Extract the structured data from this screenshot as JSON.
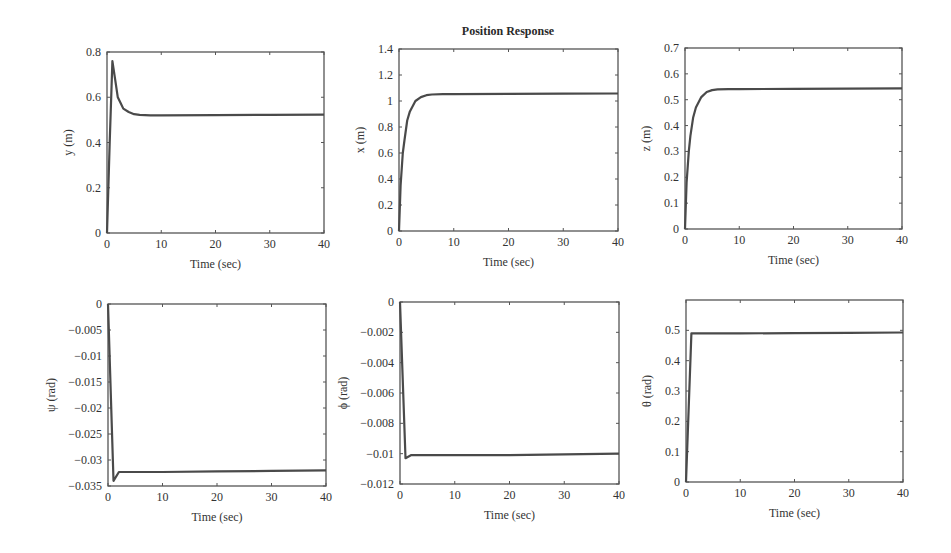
{
  "figure": {
    "title": "Position Response"
  },
  "chart_data": [
    {
      "type": "line",
      "title": "Position Response",
      "position": "top-left",
      "xlabel": "Time (sec)",
      "ylabel": "y (m)",
      "xlim": [
        0,
        40
      ],
      "ylim": [
        0,
        0.8
      ],
      "xticks": [
        0,
        10,
        20,
        30,
        40
      ],
      "yticks": [
        0,
        0.2,
        0.4,
        0.6,
        0.8
      ],
      "ytick_labels": [
        "0",
        "0.2",
        "0.4",
        "0.6",
        "0.8"
      ],
      "grid": false,
      "series": [
        {
          "name": "y",
          "x": [
            0,
            0.5,
            1,
            1.5,
            2,
            2.5,
            3,
            4,
            5,
            6,
            8,
            10,
            20,
            30,
            40
          ],
          "values": [
            0,
            0.4,
            0.76,
            0.68,
            0.6,
            0.575,
            0.55,
            0.535,
            0.525,
            0.522,
            0.52,
            0.52,
            0.521,
            0.522,
            0.523
          ]
        }
      ]
    },
    {
      "type": "line",
      "position": "top-middle",
      "xlabel": "Time (sec)",
      "ylabel": "x (m)",
      "xlim": [
        0,
        40
      ],
      "ylim": [
        0,
        1.4
      ],
      "xticks": [
        0,
        10,
        20,
        30,
        40
      ],
      "yticks": [
        0,
        0.2,
        0.4,
        0.6,
        0.8,
        1,
        1.2,
        1.4
      ],
      "ytick_labels": [
        "0",
        "0.2",
        "0.4",
        "0.6",
        "0.8",
        "1",
        "1.2",
        "1.4"
      ],
      "grid": false,
      "series": [
        {
          "name": "x",
          "x": [
            0,
            0.3,
            0.7,
            1,
            1.5,
            2,
            3,
            4,
            5,
            6,
            8,
            10,
            20,
            30,
            40
          ],
          "values": [
            0,
            0.35,
            0.6,
            0.7,
            0.85,
            0.92,
            1.0,
            1.03,
            1.045,
            1.05,
            1.052,
            1.052,
            1.055,
            1.057,
            1.058
          ]
        }
      ]
    },
    {
      "type": "line",
      "position": "top-right",
      "xlabel": "Time (sec)",
      "ylabel": "z (m)",
      "xlim": [
        0,
        40
      ],
      "ylim": [
        0,
        0.7
      ],
      "xticks": [
        0,
        10,
        20,
        30,
        40
      ],
      "yticks": [
        0,
        0.1,
        0.2,
        0.3,
        0.4,
        0.5,
        0.6,
        0.7
      ],
      "ytick_labels": [
        "0",
        "0.1",
        "0.2",
        "0.3",
        "0.4",
        "0.5",
        "0.6",
        "0.7"
      ],
      "grid": false,
      "series": [
        {
          "name": "z",
          "x": [
            0,
            0.3,
            0.7,
            1,
            1.5,
            2,
            3,
            4,
            5,
            6,
            8,
            10,
            20,
            30,
            40
          ],
          "values": [
            0,
            0.18,
            0.3,
            0.36,
            0.43,
            0.47,
            0.51,
            0.53,
            0.537,
            0.54,
            0.541,
            0.541,
            0.542,
            0.543,
            0.544
          ]
        }
      ]
    },
    {
      "type": "line",
      "position": "bottom-left",
      "xlabel": "Time (sec)",
      "ylabel": "ψ (rad)",
      "xlim": [
        0,
        40
      ],
      "ylim": [
        -0.035,
        0
      ],
      "xticks": [
        0,
        10,
        20,
        30,
        40
      ],
      "yticks": [
        -0.035,
        -0.03,
        -0.025,
        -0.02,
        -0.015,
        -0.01,
        -0.005,
        0
      ],
      "ytick_labels": [
        "−0.035",
        "−0.03",
        "−0.025",
        "−0.02",
        "−0.015",
        "−0.01",
        "−0.005",
        "0"
      ],
      "grid": false,
      "series": [
        {
          "name": "psi",
          "x": [
            0,
            1,
            2,
            5,
            10,
            20,
            30,
            40
          ],
          "values": [
            0,
            -0.034,
            -0.0323,
            -0.0323,
            -0.0323,
            -0.0322,
            -0.0321,
            -0.032
          ]
        }
      ]
    },
    {
      "type": "line",
      "position": "bottom-middle",
      "xlabel": "Time (sec)",
      "ylabel": "ϕ (rad)",
      "xlim": [
        0,
        40
      ],
      "ylim": [
        -0.012,
        0
      ],
      "xticks": [
        0,
        10,
        20,
        30,
        40
      ],
      "yticks": [
        -0.012,
        -0.01,
        -0.008,
        -0.006,
        -0.004,
        -0.002,
        0
      ],
      "ytick_labels": [
        "−0.012",
        "−0.01",
        "−0.008",
        "−0.006",
        "−0.004",
        "−0.002",
        "0"
      ],
      "grid": false,
      "series": [
        {
          "name": "phi",
          "x": [
            0,
            1,
            2,
            5,
            10,
            20,
            30,
            40
          ],
          "values": [
            0,
            -0.0103,
            -0.0101,
            -0.0101,
            -0.0101,
            -0.0101,
            -0.01005,
            -0.01
          ]
        }
      ]
    },
    {
      "type": "line",
      "position": "bottom-right",
      "xlabel": "Time (sec)",
      "ylabel": "θ (rad)",
      "xlim": [
        0,
        40
      ],
      "ylim": [
        0,
        0.6
      ],
      "xticks": [
        0,
        10,
        20,
        30,
        40
      ],
      "yticks": [
        0,
        0.1,
        0.2,
        0.3,
        0.4,
        0.5
      ],
      "ytick_labels": [
        "0",
        "0.1",
        "0.2",
        "0.3",
        "0.4",
        "0.5"
      ],
      "grid": false,
      "series": [
        {
          "name": "theta",
          "x": [
            0,
            1,
            2,
            5,
            10,
            20,
            30,
            40
          ],
          "values": [
            0,
            0.49,
            0.49,
            0.49,
            0.49,
            0.491,
            0.492,
            0.493
          ]
        }
      ]
    }
  ],
  "layout": {
    "axes_boxes": [
      {
        "left": 107,
        "top": 52,
        "right": 324,
        "bottom": 233
      },
      {
        "left": 399,
        "top": 49,
        "right": 618,
        "bottom": 231
      },
      {
        "left": 685,
        "top": 48,
        "right": 902,
        "bottom": 229
      },
      {
        "left": 108,
        "top": 304,
        "right": 326,
        "bottom": 486
      },
      {
        "left": 400,
        "top": 302,
        "right": 619,
        "bottom": 484
      },
      {
        "left": 686,
        "top": 300,
        "right": 903,
        "bottom": 482
      }
    ],
    "line_color": "#4a4a4a",
    "axis_color": "#555555"
  }
}
